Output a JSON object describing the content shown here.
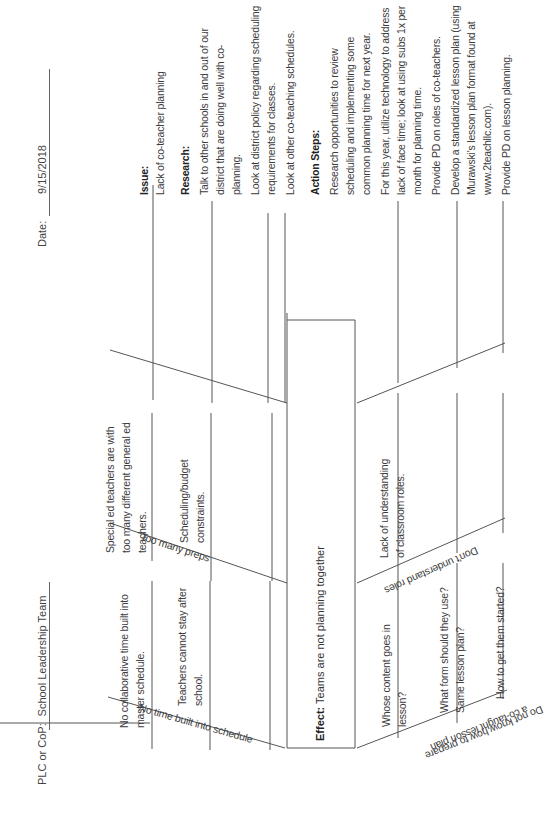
{
  "header": {
    "plc_label": "PLC or CoP:",
    "plc_value": "School Leadership Team",
    "date_label": "Date:",
    "date_value": "9/15/2018"
  },
  "effect": {
    "label": "Effect:",
    "text": "Teams are not planning together"
  },
  "bones": [
    {
      "id": "no-time",
      "label": "No time built into schedule",
      "causes": [
        "No collaborative time built into master schedule.",
        "Teachers cannot stay after school."
      ]
    },
    {
      "id": "too-many-preps",
      "label": "Too many preps",
      "causes": [
        "Special ed teachers are with too many different general ed teachers.",
        "Scheduling/budget constraints."
      ]
    },
    {
      "id": "lesson-plan",
      "label_line1": "Do not know how to prepare",
      "label_line2": "a co-taught lesson plan",
      "causes": [
        "Whose content goes in lesson?",
        "What form should they use? Same lesson plan?",
        "How to get them started?"
      ]
    },
    {
      "id": "roles",
      "label": "Don't understand roles",
      "causes": [
        "Lack of understanding of classroom roles."
      ]
    }
  ],
  "cause_lines": {
    "no_time_1_a": "No collaborative time built into",
    "no_time_1_b": "master schedule.",
    "no_time_2_a": "Teachers cannot stay after",
    "no_time_2_b": "school.",
    "preps_1_a": "Special ed teachers are with",
    "preps_1_b": "too many different general ed",
    "preps_1_c": "teachers.",
    "preps_2_a": "Scheduling/budget",
    "preps_2_b": "constraints.",
    "lesson_1_a": "Whose content goes in",
    "lesson_1_b": "lesson?",
    "lesson_2_a": "What form should they use?",
    "lesson_2_b": "Same lesson plan?",
    "lesson_3_a": "How to get them started?",
    "roles_1_a": "Lack of understanding",
    "roles_1_b": "of classroom roles."
  },
  "side_panel": {
    "issue_heading": "Issue:",
    "issue_text": "Lack of co-teacher planning",
    "research_heading": "Research:",
    "research_items": [
      "Talk to other schools in and out of our district that are doing well with co-planning.",
      "Look at district policy regarding scheduling requirements for classes.",
      "Look at other co-teaching schedules."
    ],
    "action_heading": "Action Steps:",
    "action_items": [
      "Research opportunities to review scheduling and implementing some common planning time for next year.",
      "For this year, utilize technology to address lack of face time; look at using subs 1x per month for planning time.",
      "Provide PD on roles of co-teachers.",
      "Develop a standardized lesson plan (using Murawski's lesson plan format found at www.2teachllc.com).",
      "Provide PD on lesson planning."
    ]
  }
}
